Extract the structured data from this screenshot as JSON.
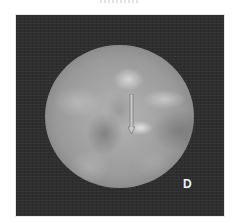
{
  "figure": {
    "panel_label": "D",
    "type": "endoscopic-view",
    "colors": {
      "panel_background": "#2e2e2e",
      "scope_mid_tone": "#a6a6a6",
      "arrow_fill": "#c8c8c8",
      "arrow_outline": "#6a6a6a",
      "label_color": "#f2f2f2"
    },
    "annotations": [
      {
        "kind": "arrow",
        "direction": "down",
        "icon": "arrow-down-icon"
      }
    ]
  }
}
